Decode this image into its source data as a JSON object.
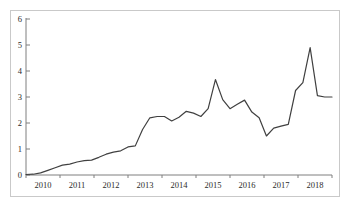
{
  "chart_data": {
    "type": "line",
    "title": "",
    "subtitle": "",
    "xlabel": "",
    "ylabel": "",
    "ylim": [
      0,
      6
    ],
    "yticks": [
      0,
      1,
      2,
      3,
      4,
      5,
      6
    ],
    "ytick_labels": [
      "0",
      "1",
      "2",
      "3",
      "4",
      "5",
      "6"
    ],
    "categories": [
      "2010",
      "2011",
      "2012",
      "2013",
      "2014",
      "2015",
      "2016",
      "2017",
      "2018"
    ],
    "xtick_labels": [
      "2010",
      "2011",
      "2012",
      "2013",
      "2014",
      "2015",
      "2016",
      "2017",
      "2018"
    ],
    "grid": false,
    "legend": false,
    "legend_position": "none",
    "line_color": "#404040",
    "line_width": 1.2,
    "markers": false,
    "axis_color": "#7f7f7f",
    "frame_color": "#c9c9c9",
    "x_start_year": 2010,
    "x_end_year": 2018.75,
    "points_per_year": 4,
    "series": [
      {
        "name": "series-1",
        "x": [
          2010.0,
          2010.25,
          2010.5,
          2010.75,
          2011.0,
          2011.25,
          2011.5,
          2011.75,
          2012.0,
          2012.25,
          2012.5,
          2012.75,
          2013.0,
          2013.25,
          2013.5,
          2013.75,
          2014.0,
          2014.25,
          2014.5,
          2014.75,
          2015.0,
          2015.25,
          2015.5,
          2015.75,
          2016.0,
          2016.25,
          2016.5,
          2016.75,
          2017.0,
          2017.25,
          2017.5,
          2017.75,
          2018.0,
          2018.25,
          2018.5,
          2018.75
        ],
        "values": [
          0.02,
          0.03,
          0.08,
          0.18,
          0.28,
          0.38,
          0.42,
          0.5,
          0.55,
          0.57,
          0.68,
          0.8,
          0.88,
          0.93,
          1.08,
          1.12,
          1.75,
          2.2,
          2.25,
          2.25,
          2.08,
          2.22,
          2.45,
          2.38,
          2.25,
          2.55,
          3.67,
          2.9,
          2.55,
          2.72,
          2.88,
          2.42,
          2.2,
          1.5,
          1.8,
          1.88
        ]
      }
    ],
    "annotations": [
      {
        "label": "peak",
        "x": 2015.5,
        "y": 3.67
      },
      {
        "label": "trough",
        "x": 2017.1,
        "y": 1.5
      },
      {
        "label": "max",
        "x": 2018.4,
        "y": 4.9
      },
      {
        "label": "end",
        "x": 2018.9,
        "y": 3.0
      }
    ],
    "series_full": [
      0.02,
      0.03,
      0.08,
      0.18,
      0.28,
      0.38,
      0.42,
      0.5,
      0.55,
      0.57,
      0.68,
      0.8,
      0.88,
      0.93,
      1.08,
      1.12,
      1.75,
      2.2,
      2.25,
      2.25,
      2.08,
      2.22,
      2.45,
      2.38,
      2.25,
      2.55,
      3.67,
      2.9,
      2.55,
      2.72,
      2.88,
      2.42,
      2.2,
      1.5,
      1.8,
      1.88,
      1.95,
      3.25,
      3.55,
      4.9,
      3.05,
      3.0,
      3.0
    ]
  },
  "axes": {
    "y_labels": [
      "6",
      "5",
      "4",
      "3",
      "2",
      "1",
      "0"
    ],
    "x_labels": [
      "2010",
      "2011",
      "2012",
      "2013",
      "2014",
      "2015",
      "2016",
      "2017",
      "2018"
    ]
  }
}
